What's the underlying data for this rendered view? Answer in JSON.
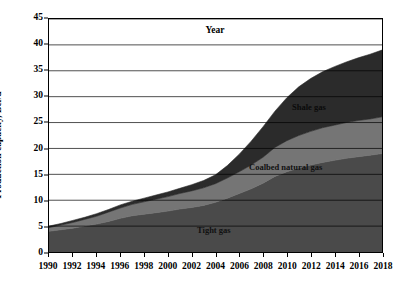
{
  "chart_data": {
    "type": "area",
    "stacked": true,
    "title": "",
    "xlabel": "Year",
    "ylabel": "Production capacity, Bcf/d",
    "xlim": [
      1990,
      2018
    ],
    "ylim": [
      0,
      45
    ],
    "ytick_step": 5,
    "xtick_step": 2,
    "grid": "horizontal",
    "legend_position": "inline-annotations",
    "x": [
      1990,
      1991,
      1992,
      1993,
      1994,
      1995,
      1996,
      1997,
      1998,
      1999,
      2000,
      2001,
      2002,
      2003,
      2004,
      2005,
      2006,
      2007,
      2008,
      2009,
      2010,
      2011,
      2012,
      2013,
      2014,
      2015,
      2016,
      2017,
      2018
    ],
    "ytick_labels": [
      "0",
      "5",
      "10",
      "15",
      "20",
      "25",
      "30",
      "35",
      "40",
      "45"
    ],
    "xtick_labels": [
      "1990",
      "1992",
      "1994",
      "1996",
      "1998",
      "2000",
      "2002",
      "2004",
      "2006",
      "2008",
      "2010",
      "2012",
      "2014",
      "2016",
      "2018"
    ],
    "series": [
      {
        "name": "Tight gas",
        "color": "#4a4a4a",
        "values": [
          4.0,
          4.3,
          4.6,
          5.0,
          5.4,
          5.9,
          6.5,
          7.0,
          7.3,
          7.6,
          7.9,
          8.3,
          8.6,
          9.0,
          9.6,
          10.4,
          11.3,
          12.2,
          13.3,
          14.6,
          15.5,
          16.2,
          16.8,
          17.3,
          17.7,
          18.1,
          18.4,
          18.7,
          19.0
        ]
      },
      {
        "name": "Coalbed natural gas",
        "color": "#757575",
        "values": [
          0.7,
          0.9,
          1.1,
          1.3,
          1.5,
          1.8,
          2.0,
          2.2,
          2.4,
          2.6,
          2.8,
          3.0,
          3.2,
          3.4,
          3.6,
          3.9,
          4.2,
          4.6,
          5.0,
          5.6,
          6.0,
          6.3,
          6.5,
          6.7,
          6.8,
          6.9,
          7.0,
          7.0,
          7.1
        ]
      },
      {
        "name": "Shale gas",
        "color": "#2b2b2b",
        "values": [
          0.3,
          0.3,
          0.4,
          0.4,
          0.5,
          0.5,
          0.6,
          0.6,
          0.7,
          0.8,
          0.9,
          1.0,
          1.2,
          1.4,
          1.7,
          2.4,
          3.4,
          4.6,
          5.9,
          7.0,
          8.3,
          9.4,
          10.2,
          10.8,
          11.3,
          11.7,
          12.1,
          12.5,
          12.9
        ]
      }
    ],
    "totals": [
      5.0,
      5.5,
      6.1,
      6.7,
      7.4,
      8.2,
      9.1,
      9.8,
      10.4,
      11.0,
      11.6,
      12.3,
      13.0,
      13.8,
      14.9,
      16.7,
      18.9,
      21.4,
      24.2,
      27.2,
      29.8,
      31.9,
      33.5,
      34.8,
      35.8,
      36.7,
      37.5,
      38.2,
      39.0
    ],
    "annotations": [
      {
        "text": "Shale gas",
        "series": "Shale gas"
      },
      {
        "text": "Coalbed natural gas",
        "series": "Coalbed natural gas"
      },
      {
        "text": "Tight gas",
        "series": "Tight gas"
      }
    ]
  }
}
